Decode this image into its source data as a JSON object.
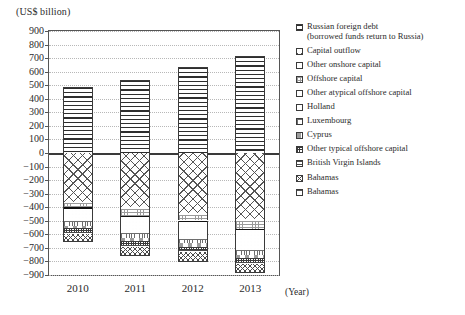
{
  "figure": {
    "unit_caption": "(US$ billion)",
    "x_axis_unit": "(Year)"
  },
  "chart_data": {
    "type": "bar",
    "stacked": true,
    "title": "",
    "subtitle": "",
    "xlabel": "(Year)",
    "ylabel": "(US$ billion)",
    "categories": [
      "2010",
      "2011",
      "2012",
      "2013"
    ],
    "ylim": [
      -900,
      900
    ],
    "ytick_step": 100,
    "yticks": [
      900,
      800,
      700,
      600,
      500,
      400,
      300,
      200,
      100,
      0,
      -100,
      -200,
      -300,
      -400,
      -500,
      -600,
      -700,
      -800,
      -900
    ],
    "ytick_labels": [
      "900",
      "800",
      "700",
      "600",
      "500",
      "400",
      "300",
      "200",
      "100",
      "0",
      "−100",
      "−200",
      "−300",
      "−400",
      "−500",
      "−600",
      "−700",
      "−800",
      "−900"
    ],
    "grid": true,
    "legend_position": "right",
    "series": [
      {
        "name": "Russian foreign debt (borrowed funds return to Russia)",
        "legend_label": "Russian foreign debt\n(borrowed funds return to Russia)",
        "pattern": "p-hlines",
        "sign": "positive",
        "values": [
          485,
          540,
          632,
          712
        ]
      },
      {
        "name": "Capital outflow",
        "legend_label": "Capital outflow",
        "pattern": "p-crosshatch",
        "sign": "negative",
        "values": [
          -360,
          -398,
          -440,
          -485
        ]
      },
      {
        "name": "Other onshore capital",
        "legend_label": "Other onshore capital",
        "pattern": "p-plain",
        "sign": "negative",
        "values": [
          -12,
          -14,
          -14,
          -16
        ]
      },
      {
        "name": "Offshore capital",
        "legend_label": "Offshore capital",
        "pattern": "p-grid",
        "sign": "negative",
        "values": [
          -30,
          -52,
          -44,
          -58
        ]
      },
      {
        "name": "Other atypical offshore capital",
        "legend_label": "Other atypical offshore capital",
        "pattern": "p-solid",
        "sign": "negative",
        "values": [
          -8,
          -10,
          -9,
          -12
        ]
      },
      {
        "name": "Holland",
        "legend_label": "Holland",
        "pattern": "p-dots",
        "sign": "negative",
        "values": [
          -92,
          -118,
          -124,
          -142
        ]
      },
      {
        "name": "Luxembourg",
        "legend_label": "Luxembourg",
        "pattern": "p-checker",
        "sign": "negative",
        "values": [
          -36,
          -34,
          -36,
          -40
        ]
      },
      {
        "name": "Cyprus",
        "legend_label": "Cyprus",
        "pattern": "p-lightdash",
        "sign": "negative",
        "values": [
          -18,
          -24,
          -24,
          -22
        ]
      },
      {
        "name": "Other typical offshore capital",
        "legend_label": "Other typical offshore capital",
        "pattern": "p-denseChecker",
        "sign": "negative",
        "values": [
          -30,
          -32,
          -28,
          -30
        ]
      },
      {
        "name": "British Virgin Islands",
        "legend_label": "British Virgin Islands",
        "pattern": "p-hlines2",
        "sign": "negative",
        "values": [
          -10,
          -12,
          -12,
          -14
        ]
      },
      {
        "name": "Bahamas",
        "legend_label": "Bahamas",
        "pattern": "p-bahamasA",
        "sign": "negative",
        "values": [
          -64,
          -68,
          -71,
          -69
        ]
      },
      {
        "name": "Bahamas",
        "legend_label": "Bahamas",
        "pattern": "p-bahamasB",
        "sign": "negative",
        "values": [
          0,
          0,
          0,
          0
        ]
      }
    ],
    "bar_totals_positive": [
      485,
      540,
      632,
      712
    ],
    "bar_totals_negative": [
      -660,
      -762,
      -802,
      -888
    ]
  }
}
